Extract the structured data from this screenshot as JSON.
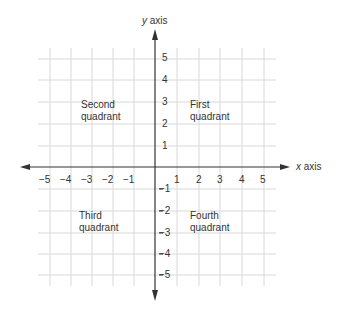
{
  "diagram": {
    "type": "cartesian-coordinate-plane",
    "x_axis_label_var": "x",
    "x_axis_label_word": "axis",
    "y_axis_label_var": "y",
    "y_axis_label_word": "axis",
    "x_ticks": [
      "−5",
      "−4",
      "−3",
      "−2",
      "−1",
      "1",
      "2",
      "3",
      "4",
      "5"
    ],
    "y_ticks_positive": [
      "5",
      "4",
      "3",
      "2",
      "1"
    ],
    "y_ticks_negative": [
      "−1",
      "−2",
      "−3",
      "−4",
      "−5"
    ],
    "quadrants": {
      "first": {
        "line1": "First",
        "line2": "quadrant"
      },
      "second": {
        "line1": "Second",
        "line2": "quadrant"
      },
      "third": {
        "line1": "Third",
        "line2": "quadrant"
      },
      "fourth": {
        "line1": "Fourth",
        "line2": "quadrant"
      }
    },
    "colors": {
      "grid": "#d8d8d8",
      "axis": "#333333",
      "text": "#333333"
    }
  }
}
